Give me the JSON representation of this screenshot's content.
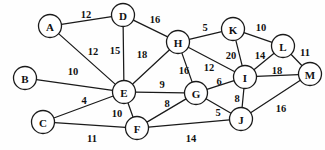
{
  "figure": {
    "background_color": "#fefefe",
    "stroke_color": "#1a1a1a",
    "text_color": "#111111",
    "node_radius": 11.5,
    "width": 325,
    "height": 150
  },
  "chart_data": {
    "type": "diagram",
    "subtype": "weighted-undirected-graph",
    "node_count": 13,
    "edge_count": 24,
    "nodes": [
      {
        "id": "A",
        "label": "A",
        "x": 50,
        "y": 26
      },
      {
        "id": "B",
        "label": "B",
        "x": 25,
        "y": 78
      },
      {
        "id": "C",
        "label": "C",
        "x": 43,
        "y": 122
      },
      {
        "id": "D",
        "label": "D",
        "x": 123,
        "y": 15
      },
      {
        "id": "E",
        "label": "E",
        "x": 124,
        "y": 92
      },
      {
        "id": "F",
        "label": "F",
        "x": 137,
        "y": 128
      },
      {
        "id": "G",
        "label": "G",
        "x": 196,
        "y": 93
      },
      {
        "id": "H",
        "label": "H",
        "x": 178,
        "y": 42
      },
      {
        "id": "I",
        "label": "I",
        "x": 245,
        "y": 77
      },
      {
        "id": "J",
        "label": "J",
        "x": 241,
        "y": 119
      },
      {
        "id": "K",
        "label": "K",
        "x": 233,
        "y": 29
      },
      {
        "id": "L",
        "label": "L",
        "x": 283,
        "y": 46
      },
      {
        "id": "M",
        "label": "M",
        "x": 310,
        "y": 74
      }
    ],
    "edges": [
      {
        "source": "A",
        "target": "D",
        "weight": 12,
        "label_x": 86,
        "label_y": 14
      },
      {
        "source": "A",
        "target": "E",
        "weight": 12,
        "label_x": 93,
        "label_y": 51
      },
      {
        "source": "B",
        "target": "E",
        "weight": 10,
        "label_x": 73,
        "label_y": 71
      },
      {
        "source": "C",
        "target": "E",
        "weight": 4,
        "label_x": 84,
        "label_y": 100
      },
      {
        "source": "C",
        "target": "F",
        "weight": 11,
        "label_x": 92,
        "label_y": 138
      },
      {
        "source": "D",
        "target": "E",
        "weight": 15,
        "label_x": 115,
        "label_y": 50
      },
      {
        "source": "D",
        "target": "H",
        "weight": 16,
        "label_x": 155,
        "label_y": 19
      },
      {
        "source": "E",
        "target": "H",
        "weight": 18,
        "label_x": 142,
        "label_y": 54
      },
      {
        "source": "E",
        "target": "G",
        "weight": 9,
        "label_x": 162,
        "label_y": 84
      },
      {
        "source": "E",
        "target": "F",
        "weight": 10,
        "label_x": 117,
        "label_y": 113
      },
      {
        "source": "F",
        "target": "G",
        "weight": 8,
        "label_x": 167,
        "label_y": 103
      },
      {
        "source": "F",
        "target": "J",
        "weight": 14,
        "label_x": 191,
        "label_y": 138
      },
      {
        "source": "G",
        "target": "H",
        "weight": 16,
        "label_x": 184,
        "label_y": 70
      },
      {
        "source": "G",
        "target": "I",
        "weight": 6,
        "label_x": 219,
        "label_y": 81
      },
      {
        "source": "G",
        "target": "J",
        "weight": 5,
        "label_x": 218,
        "label_y": 112
      },
      {
        "source": "H",
        "target": "I",
        "weight": 12,
        "label_x": 209,
        "label_y": 67
      },
      {
        "source": "H",
        "target": "K",
        "weight": 5,
        "label_x": 205,
        "label_y": 27
      },
      {
        "source": "I",
        "target": "K",
        "weight": 20,
        "label_x": 231,
        "label_y": 55
      },
      {
        "source": "I",
        "target": "L",
        "weight": 14,
        "label_x": 260,
        "label_y": 55
      },
      {
        "source": "I",
        "target": "M",
        "weight": 18,
        "label_x": 277,
        "label_y": 70
      },
      {
        "source": "I",
        "target": "J",
        "weight": 8,
        "label_x": 237,
        "label_y": 98
      },
      {
        "source": "J",
        "target": "M",
        "weight": 16,
        "label_x": 281,
        "label_y": 108
      },
      {
        "source": "K",
        "target": "L",
        "weight": 10,
        "label_x": 261,
        "label_y": 27
      },
      {
        "source": "L",
        "target": "M",
        "weight": 11,
        "label_x": 305,
        "label_y": 52
      }
    ]
  }
}
